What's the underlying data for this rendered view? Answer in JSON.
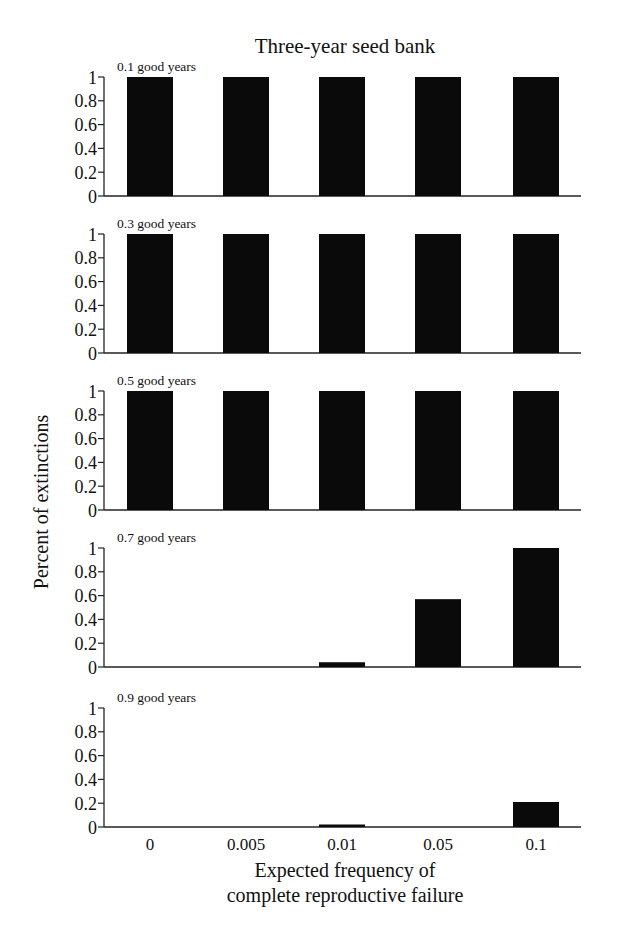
{
  "chart_data": {
    "type": "bar",
    "title": "Three-year seed bank",
    "xlabel": "Expected frequency of complete reproductive failure",
    "xlabel_lines": [
      "Expected frequency of",
      "complete reproductive failure"
    ],
    "ylabel": "Percent of extinctions",
    "categories": [
      "0",
      "0.005",
      "0.01",
      "0.05",
      "0.1"
    ],
    "yticks": [
      "0",
      "0.2",
      "0.4",
      "0.6",
      "0.8",
      "1"
    ],
    "ylim": [
      0,
      1
    ],
    "grid": false,
    "legend": null,
    "bar_color": "#0a0a0a",
    "panels": [
      {
        "label": "0.1 good years",
        "values": [
          1,
          1,
          1,
          1,
          1
        ]
      },
      {
        "label": "0.3 good years",
        "values": [
          1,
          1,
          1,
          1,
          1
        ]
      },
      {
        "label": "0.5 good years",
        "values": [
          1,
          1,
          1,
          1,
          1
        ]
      },
      {
        "label": "0.7 good years",
        "values": [
          0,
          0,
          0.04,
          0.57,
          1
        ]
      },
      {
        "label": "0.9 good years",
        "values": [
          0,
          0,
          0.02,
          0,
          0.21
        ]
      }
    ]
  }
}
